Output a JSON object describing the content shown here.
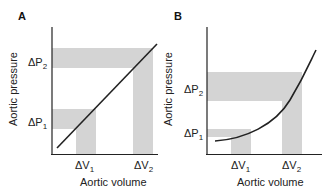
{
  "panels": [
    {
      "id": "A",
      "label": "A",
      "xlabel": "Aortic volume",
      "ylabel": "Aortic pressure",
      "curve": "linear",
      "ticks_x": [
        {
          "base": "ΔV",
          "sub": "1"
        },
        {
          "base": "ΔV",
          "sub": "2"
        }
      ],
      "ticks_y": [
        {
          "base": "ΔP",
          "sub": "1"
        },
        {
          "base": "ΔP",
          "sub": "2"
        }
      ]
    },
    {
      "id": "B",
      "label": "B",
      "xlabel": "Aortic volume",
      "ylabel": "Aortic pressure",
      "curve": "exponential",
      "ticks_x": [
        {
          "base": "ΔV",
          "sub": "1"
        },
        {
          "base": "ΔV",
          "sub": "2"
        }
      ],
      "ticks_y": [
        {
          "base": "ΔP",
          "sub": "1"
        },
        {
          "base": "ΔP",
          "sub": "2"
        }
      ]
    }
  ],
  "colors": {
    "band": "#d4d4d4",
    "line": "#222222",
    "axis": "#222222"
  }
}
